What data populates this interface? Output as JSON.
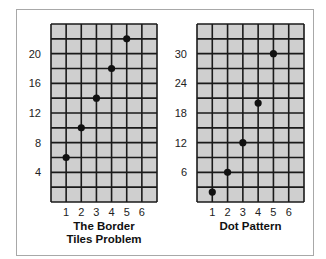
{
  "chart_data": [
    {
      "type": "scatter",
      "title": "The Border Tiles Problem",
      "title_lines": [
        "The Border",
        "Tiles Problem"
      ],
      "xlabel": "",
      "ylabel": "",
      "x_ticks": [
        1,
        2,
        3,
        4,
        5,
        6
      ],
      "y_ticks": [
        4,
        8,
        12,
        16,
        20
      ],
      "xlim": [
        0,
        7
      ],
      "ylim": [
        0,
        24
      ],
      "grid": true,
      "grid_step_y": 2,
      "points": [
        {
          "x": 1,
          "y": 6
        },
        {
          "x": 2,
          "y": 10
        },
        {
          "x": 3,
          "y": 14
        },
        {
          "x": 4,
          "y": 18
        },
        {
          "x": 5,
          "y": 22
        }
      ]
    },
    {
      "type": "scatter",
      "title": "Dot Pattern",
      "title_lines": [
        "Dot Pattern"
      ],
      "xlabel": "",
      "ylabel": "",
      "x_ticks": [
        1,
        2,
        3,
        4,
        5,
        6
      ],
      "y_ticks": [
        6,
        12,
        18,
        24,
        30
      ],
      "xlim": [
        0,
        7
      ],
      "ylim": [
        0,
        36
      ],
      "grid": true,
      "grid_step_y": 3,
      "points": [
        {
          "x": 1,
          "y": 2
        },
        {
          "x": 2,
          "y": 6
        },
        {
          "x": 3,
          "y": 12
        },
        {
          "x": 4,
          "y": 20
        },
        {
          "x": 5,
          "y": 30
        }
      ]
    }
  ],
  "style": {
    "grid_fill": "#cfcfcf",
    "grid_line": "#1a1a1a",
    "dot_color": "#111111",
    "frame_border": "#a8a8a8"
  }
}
